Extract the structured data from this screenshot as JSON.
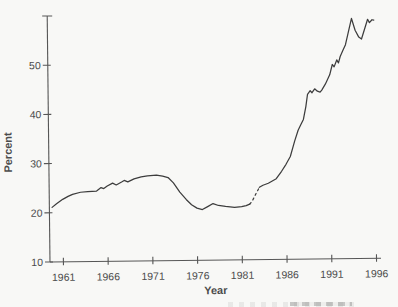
{
  "page": {
    "background_color": "#f8f8f6",
    "ink_color": "#3d3d3d",
    "axis_color": "#565656",
    "label_color": "#4c4c4c"
  },
  "chart_data": {
    "type": "line",
    "title": "",
    "xlabel": "Year",
    "ylabel": "Percent",
    "xlim": [
      1959.5,
      1996.5
    ],
    "ylim": [
      10,
      60
    ],
    "xticks": [
      1961,
      1966,
      1971,
      1976,
      1981,
      1986,
      1991,
      1996
    ],
    "yticks": [
      10,
      20,
      30,
      40,
      50
    ],
    "unlabeled_top_tick": 60,
    "grid": false,
    "legend": "none",
    "line_color": "#3d3d3d",
    "series": [
      {
        "name": "percent-solid-1960-1982",
        "style": "solid",
        "points": [
          [
            1959.8,
            21.1
          ],
          [
            1960.3,
            21.8
          ],
          [
            1961.0,
            22.7
          ],
          [
            1961.6,
            23.3
          ],
          [
            1962.1,
            23.7
          ],
          [
            1963.0,
            24.1
          ],
          [
            1963.8,
            24.2
          ],
          [
            1964.8,
            24.3
          ],
          [
            1965.3,
            25.0
          ],
          [
            1965.6,
            24.8
          ],
          [
            1966.0,
            25.3
          ],
          [
            1966.6,
            25.9
          ],
          [
            1967.0,
            25.5
          ],
          [
            1967.6,
            26.1
          ],
          [
            1967.9,
            26.4
          ],
          [
            1968.3,
            26.1
          ],
          [
            1969.0,
            26.7
          ],
          [
            1969.8,
            27.1
          ],
          [
            1970.5,
            27.3
          ],
          [
            1971.5,
            27.4
          ],
          [
            1972.2,
            27.2
          ],
          [
            1972.8,
            26.9
          ],
          [
            1973.4,
            25.8
          ],
          [
            1974.1,
            23.9
          ],
          [
            1974.8,
            22.4
          ],
          [
            1975.4,
            21.3
          ],
          [
            1976.0,
            20.6
          ],
          [
            1976.6,
            20.3
          ],
          [
            1977.2,
            20.9
          ],
          [
            1977.8,
            21.5
          ],
          [
            1978.4,
            21.1
          ],
          [
            1979.2,
            20.9
          ],
          [
            1980.2,
            20.7
          ],
          [
            1981.0,
            20.8
          ],
          [
            1981.5,
            21.0
          ],
          [
            1981.9,
            21.3
          ]
        ]
      },
      {
        "name": "percent-dashed-break-1982-1983",
        "style": "dashed",
        "points": [
          [
            1981.9,
            21.3
          ],
          [
            1982.2,
            22.0
          ],
          [
            1982.6,
            23.4
          ],
          [
            1983.0,
            24.7
          ]
        ]
      },
      {
        "name": "percent-solid-1983-1996",
        "style": "solid",
        "points": [
          [
            1983.0,
            24.7
          ],
          [
            1983.4,
            25.1
          ],
          [
            1984.0,
            25.5
          ],
          [
            1984.9,
            26.4
          ],
          [
            1985.5,
            27.9
          ],
          [
            1986.0,
            29.3
          ],
          [
            1986.5,
            30.9
          ],
          [
            1987.0,
            34.0
          ],
          [
            1987.4,
            36.2
          ],
          [
            1987.7,
            37.3
          ],
          [
            1988.0,
            38.4
          ],
          [
            1988.3,
            41.0
          ],
          [
            1988.5,
            43.5
          ],
          [
            1988.8,
            44.2
          ],
          [
            1989.0,
            43.8
          ],
          [
            1989.3,
            44.6
          ],
          [
            1989.6,
            44.1
          ],
          [
            1989.9,
            43.9
          ],
          [
            1990.1,
            44.3
          ],
          [
            1990.5,
            45.5
          ],
          [
            1991.0,
            47.4
          ],
          [
            1991.3,
            49.5
          ],
          [
            1991.5,
            49.0
          ],
          [
            1991.8,
            50.4
          ],
          [
            1992.0,
            49.8
          ],
          [
            1992.2,
            51.1
          ],
          [
            1992.5,
            52.3
          ],
          [
            1992.8,
            53.5
          ],
          [
            1993.1,
            55.8
          ],
          [
            1993.5,
            58.8
          ],
          [
            1993.9,
            56.4
          ],
          [
            1994.3,
            55.0
          ],
          [
            1994.6,
            54.6
          ],
          [
            1995.0,
            56.9
          ],
          [
            1995.3,
            58.6
          ],
          [
            1995.5,
            57.9
          ],
          [
            1995.8,
            58.5
          ],
          [
            1996.0,
            58.4
          ]
        ]
      }
    ]
  }
}
